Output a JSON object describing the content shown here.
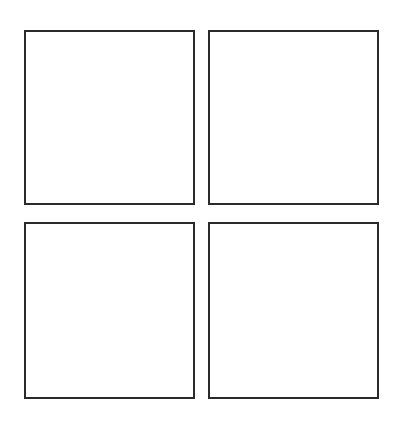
{
  "page": {
    "boxes": [
      {
        "id": "top-left",
        "content": ""
      },
      {
        "id": "top-right",
        "content": ""
      },
      {
        "id": "bottom-left",
        "content": ""
      },
      {
        "id": "bottom-right",
        "content": ""
      }
    ]
  },
  "colors": {
    "page_background": "#ffffff",
    "box_background": "#ffffff",
    "box_border": "#2b2b2b"
  }
}
